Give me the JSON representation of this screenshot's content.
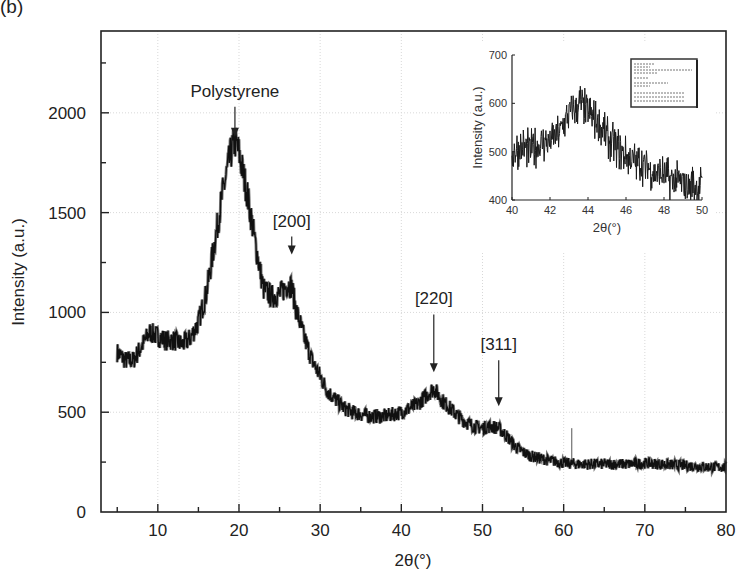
{
  "panel_label": "(b)",
  "chart_data": {
    "type": "line",
    "title": "",
    "xlabel": "2θ(°)",
    "ylabel": "Intensity (a.u.)",
    "xlim": [
      3,
      80
    ],
    "ylim": [
      0,
      2410
    ],
    "xticks": [
      10,
      20,
      30,
      40,
      50,
      60,
      70,
      80
    ],
    "yticks": [
      0,
      500,
      1000,
      1500,
      2000
    ],
    "grid": true,
    "series": [
      {
        "name": "XRD pattern",
        "color": "#111111",
        "x": [
          5,
          6,
          7,
          8,
          9,
          10,
          11,
          12,
          13,
          14,
          15,
          16,
          17,
          18,
          19,
          19.5,
          20,
          21,
          22,
          23,
          24,
          25,
          26,
          26.5,
          27,
          28,
          29,
          30,
          31,
          32,
          33,
          34,
          35,
          36,
          38,
          40,
          42,
          43,
          44,
          45,
          46,
          47,
          48,
          49,
          50,
          51,
          52,
          53,
          54,
          55,
          56,
          58,
          60,
          62,
          64,
          66,
          68,
          70,
          72,
          74,
          76,
          78,
          80
        ],
        "y": [
          800,
          760,
          760,
          830,
          900,
          880,
          860,
          860,
          840,
          870,
          950,
          1100,
          1350,
          1600,
          1800,
          1860,
          1800,
          1600,
          1350,
          1120,
          1080,
          1090,
          1140,
          1130,
          1020,
          880,
          760,
          680,
          600,
          560,
          520,
          500,
          490,
          480,
          480,
          500,
          540,
          580,
          620,
          560,
          520,
          480,
          450,
          430,
          420,
          430,
          420,
          380,
          330,
          300,
          280,
          260,
          245,
          240,
          240,
          240,
          240,
          245,
          240,
          235,
          230,
          225,
          225
        ]
      }
    ],
    "annotations": [
      {
        "text": "Polystyrene",
        "x": 19.5,
        "arrow_from_y": 2030,
        "arrow_to_y": 1880
      },
      {
        "text": "[200]",
        "x": 26.5,
        "arrow_from_y": 1380,
        "arrow_to_y": 1290
      },
      {
        "text": "[220]",
        "x": 44,
        "arrow_from_y": 990,
        "arrow_to_y": 700
      },
      {
        "text": "[311]",
        "x": 52,
        "arrow_from_y": 760,
        "arrow_to_y": 530
      }
    ],
    "inset": {
      "type": "line",
      "xlabel": "2θ(°)",
      "ylabel": "Intensity (a.u.)",
      "xlim": [
        40,
        50
      ],
      "ylim": [
        400,
        700
      ],
      "xticks": [
        40,
        42,
        44,
        46,
        48,
        50
      ],
      "yticks": [
        400,
        500,
        600,
        700
      ],
      "x": [
        40,
        40.5,
        41,
        41.5,
        42,
        42.5,
        43,
        43.3,
        43.6,
        44,
        44.5,
        45,
        45.5,
        46,
        46.5,
        47,
        47.5,
        48,
        48.5,
        49,
        49.5,
        50
      ],
      "y": [
        500,
        510,
        505,
        515,
        520,
        540,
        580,
        590,
        600,
        580,
        560,
        530,
        510,
        490,
        480,
        470,
        460,
        450,
        440,
        435,
        430,
        428
      ],
      "legend_box": "small unreadable text box (upper right)"
    }
  }
}
